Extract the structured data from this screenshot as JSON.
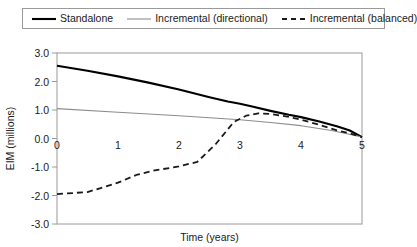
{
  "legend": {
    "position": "top",
    "entries": [
      {
        "label": "Standalone",
        "style": "solid-thick",
        "color": "#000000"
      },
      {
        "label": "Incremental (directional)",
        "style": "solid-thin",
        "color": "#8c8c8c"
      },
      {
        "label": "Incremental (balanced)",
        "style": "dashed",
        "color": "#1a1a1a"
      }
    ]
  },
  "chart_data": {
    "type": "line",
    "title": "",
    "xlabel": "Time (years)",
    "ylabel": "EIM (millions)",
    "xlim": [
      0,
      5
    ],
    "ylim": [
      -3.0,
      3.0
    ],
    "xticks": [
      0,
      1,
      2,
      3,
      4,
      5
    ],
    "xticklabels": [
      "0",
      "1",
      "2",
      "3",
      "4",
      "5"
    ],
    "yticks": [
      3.0,
      2.0,
      1.0,
      0.0,
      -1.0,
      -2.0,
      -3.0
    ],
    "yticklabels": [
      "3.0",
      "2.0",
      "1.0",
      "0.0",
      "-1.0",
      "-2.0",
      "-3.0"
    ],
    "grid": false,
    "series": [
      {
        "name": "Standalone",
        "color": "#000000",
        "width": 2.1,
        "dash": "none",
        "x": [
          0.0,
          0.5,
          1.0,
          1.5,
          2.0,
          2.5,
          2.8,
          3.0,
          3.2,
          3.5,
          3.8,
          4.0,
          4.3,
          4.6,
          4.8,
          5.0
        ],
        "y": [
          2.55,
          2.38,
          2.18,
          1.96,
          1.72,
          1.45,
          1.3,
          1.22,
          1.12,
          0.97,
          0.83,
          0.75,
          0.6,
          0.42,
          0.28,
          0.05
        ]
      },
      {
        "name": "Incremental (directional)",
        "color": "#8c8c8c",
        "width": 1.1,
        "dash": "none",
        "x": [
          0.0,
          1.0,
          2.0,
          2.5,
          3.0,
          3.5,
          4.0,
          4.5,
          5.0
        ],
        "y": [
          1.05,
          0.92,
          0.8,
          0.73,
          0.66,
          0.56,
          0.45,
          0.28,
          0.05
        ]
      },
      {
        "name": "Incremental (balanced)",
        "color": "#1a1a1a",
        "width": 1.8,
        "dash": "6,4",
        "x": [
          0.0,
          0.5,
          1.0,
          1.3,
          1.6,
          2.0,
          2.3,
          2.6,
          2.9,
          3.1,
          3.3,
          3.5,
          3.8,
          4.0,
          4.3,
          4.6,
          4.8,
          5.0
        ],
        "y": [
          -1.95,
          -1.88,
          -1.55,
          -1.28,
          -1.12,
          -0.98,
          -0.82,
          -0.2,
          0.58,
          0.8,
          0.88,
          0.86,
          0.76,
          0.66,
          0.48,
          0.28,
          0.18,
          0.05
        ]
      }
    ]
  }
}
